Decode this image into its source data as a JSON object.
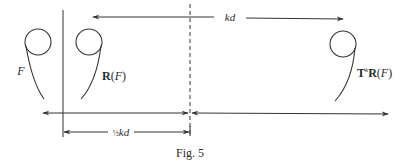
{
  "figure": {
    "caption": "Fig. 5",
    "shapes": [
      {
        "id": "F",
        "label": "F",
        "label_style": "italic"
      },
      {
        "id": "R_F",
        "label_bold": "R",
        "label_paren_open": "(",
        "label_var": "F",
        "label_paren_close": ")"
      },
      {
        "id": "Tk_R_F",
        "label_bold": "T",
        "label_sup": "k",
        "label_bold2": "R",
        "label_paren_open": "(",
        "label_var": "F",
        "label_paren_close": ")"
      }
    ],
    "dimensions": {
      "top_arrow_label": "kd",
      "bottom_arrow_label_frac": "½",
      "bottom_arrow_label_var": "kd"
    },
    "lines": {
      "mirror_line": "solid",
      "midpoint_line": "dashed"
    },
    "colors": {
      "ink": "#333333",
      "background": "#ffffff"
    }
  }
}
